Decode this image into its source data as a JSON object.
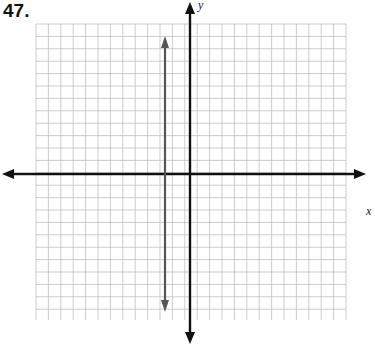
{
  "problem": {
    "number": "47."
  },
  "chart_data": {
    "type": "line",
    "title": "",
    "xlabel": "x",
    "ylabel": "y",
    "grid": true,
    "grid_cells_x": 25,
    "grid_cells_y": 24,
    "xlim": [
      -12,
      13
    ],
    "ylim": [
      -12,
      12
    ],
    "series": [
      {
        "name": "vertical line x = -2",
        "equation": "x = -2",
        "points": [
          [
            -2,
            11
          ],
          [
            -2,
            -11
          ]
        ],
        "arrows": "both"
      }
    ]
  },
  "axes": {
    "x_label": "x",
    "y_label": "y"
  }
}
